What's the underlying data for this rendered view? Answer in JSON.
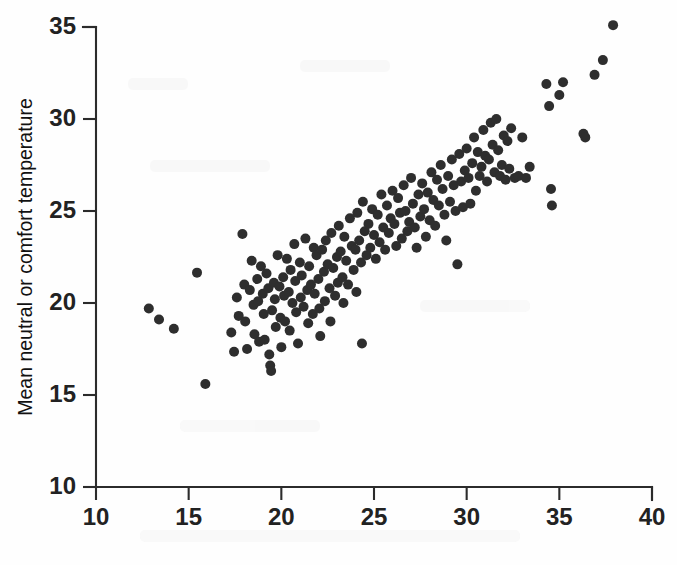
{
  "figure": {
    "background_color": "#fefefe",
    "ink_color": "#2e2e2e",
    "axis_color": "#2b2b2b"
  },
  "axes": {
    "y_title": "Mean neutral or comfort temperature",
    "x_title": "",
    "y_ticks": [
      "10",
      "15",
      "20",
      "25",
      "30",
      "35"
    ],
    "x_ticks": [
      "10",
      "15",
      "20",
      "25",
      "30",
      "35",
      "40"
    ]
  },
  "chart_data": {
    "type": "scatter",
    "title": "",
    "xlabel": "",
    "ylabel": "Mean neutral or comfort temperature",
    "xlim": [
      10,
      40
    ],
    "ylim": [
      10,
      35
    ],
    "xticks": [
      10,
      15,
      20,
      25,
      30,
      35,
      40
    ],
    "yticks": [
      10,
      15,
      20,
      25,
      30,
      35
    ],
    "grid": false,
    "legend": null,
    "marker": "filled-circle",
    "marker_color": "#2e2e2e",
    "marker_size_px": 10,
    "n_points": 186,
    "points": [
      [
        12.85,
        19.7
      ],
      [
        13.4,
        19.1
      ],
      [
        14.2,
        18.6
      ],
      [
        15.45,
        21.65
      ],
      [
        15.9,
        15.6
      ],
      [
        17.3,
        18.4
      ],
      [
        17.45,
        17.35
      ],
      [
        17.6,
        20.3
      ],
      [
        17.7,
        19.3
      ],
      [
        17.9,
        23.75
      ],
      [
        18.0,
        21.0
      ],
      [
        18.05,
        19.0
      ],
      [
        18.15,
        17.5
      ],
      [
        18.3,
        20.7
      ],
      [
        18.4,
        22.3
      ],
      [
        18.5,
        19.9
      ],
      [
        18.55,
        18.3
      ],
      [
        18.7,
        21.3
      ],
      [
        18.75,
        20.1
      ],
      [
        18.8,
        17.9
      ],
      [
        18.9,
        22.0
      ],
      [
        19.0,
        20.5
      ],
      [
        19.05,
        19.4
      ],
      [
        19.1,
        18.0
      ],
      [
        19.2,
        21.6
      ],
      [
        19.3,
        20.8
      ],
      [
        19.35,
        17.2
      ],
      [
        19.4,
        16.6
      ],
      [
        19.45,
        16.3
      ],
      [
        19.5,
        19.6
      ],
      [
        19.6,
        21.1
      ],
      [
        19.65,
        20.2
      ],
      [
        19.7,
        18.7
      ],
      [
        19.8,
        22.6
      ],
      [
        19.9,
        20.9
      ],
      [
        19.95,
        19.2
      ],
      [
        20.0,
        17.6
      ],
      [
        20.1,
        21.4
      ],
      [
        20.15,
        20.4
      ],
      [
        20.2,
        19.0
      ],
      [
        20.3,
        22.4
      ],
      [
        20.4,
        20.6
      ],
      [
        20.45,
        18.5
      ],
      [
        20.5,
        21.8
      ],
      [
        20.6,
        20.0
      ],
      [
        20.7,
        23.2
      ],
      [
        20.75,
        21.2
      ],
      [
        20.8,
        19.5
      ],
      [
        20.9,
        17.8
      ],
      [
        21.0,
        22.2
      ],
      [
        21.05,
        20.3
      ],
      [
        21.1,
        21.5
      ],
      [
        21.2,
        19.8
      ],
      [
        21.3,
        23.5
      ],
      [
        21.4,
        20.7
      ],
      [
        21.45,
        18.9
      ],
      [
        21.5,
        22.0
      ],
      [
        21.6,
        21.0
      ],
      [
        21.7,
        19.4
      ],
      [
        21.75,
        23.0
      ],
      [
        21.8,
        20.5
      ],
      [
        21.9,
        22.6
      ],
      [
        22.0,
        21.3
      ],
      [
        22.05,
        19.7
      ],
      [
        22.1,
        18.2
      ],
      [
        22.2,
        22.9
      ],
      [
        22.3,
        21.7
      ],
      [
        22.35,
        20.1
      ],
      [
        22.4,
        23.4
      ],
      [
        22.5,
        22.1
      ],
      [
        22.6,
        20.8
      ],
      [
        22.65,
        19.0
      ],
      [
        22.7,
        23.8
      ],
      [
        22.8,
        21.9
      ],
      [
        22.9,
        20.4
      ],
      [
        23.0,
        22.5
      ],
      [
        23.05,
        21.1
      ],
      [
        23.1,
        24.2
      ],
      [
        23.2,
        22.8
      ],
      [
        23.3,
        21.4
      ],
      [
        23.35,
        20.0
      ],
      [
        23.4,
        23.6
      ],
      [
        23.5,
        22.3
      ],
      [
        23.6,
        21.0
      ],
      [
        23.7,
        24.6
      ],
      [
        23.8,
        23.1
      ],
      [
        23.9,
        21.8
      ],
      [
        24.0,
        22.9
      ],
      [
        24.05,
        20.6
      ],
      [
        24.1,
        24.9
      ],
      [
        24.2,
        23.4
      ],
      [
        24.3,
        22.2
      ],
      [
        24.35,
        17.8
      ],
      [
        24.4,
        25.5
      ],
      [
        24.5,
        23.9
      ],
      [
        24.6,
        22.6
      ],
      [
        24.7,
        24.3
      ],
      [
        24.8,
        23.0
      ],
      [
        24.9,
        25.1
      ],
      [
        25.0,
        23.7
      ],
      [
        25.1,
        22.4
      ],
      [
        25.2,
        24.8
      ],
      [
        25.3,
        23.3
      ],
      [
        25.4,
        25.9
      ],
      [
        25.5,
        24.1
      ],
      [
        25.6,
        22.9
      ],
      [
        25.7,
        25.3
      ],
      [
        25.8,
        23.8
      ],
      [
        25.9,
        24.6
      ],
      [
        26.0,
        26.1
      ],
      [
        26.1,
        24.3
      ],
      [
        26.2,
        23.1
      ],
      [
        26.3,
        25.7
      ],
      [
        26.4,
        24.9
      ],
      [
        26.5,
        23.5
      ],
      [
        26.6,
        26.4
      ],
      [
        26.7,
        25.0
      ],
      [
        26.8,
        23.9
      ],
      [
        26.9,
        24.4
      ],
      [
        27.0,
        26.8
      ],
      [
        27.1,
        25.4
      ],
      [
        27.2,
        24.1
      ],
      [
        27.3,
        23.0
      ],
      [
        27.4,
        25.9
      ],
      [
        27.5,
        24.7
      ],
      [
        27.6,
        26.5
      ],
      [
        27.7,
        25.1
      ],
      [
        27.8,
        23.6
      ],
      [
        27.9,
        26.0
      ],
      [
        28.0,
        24.5
      ],
      [
        28.1,
        27.1
      ],
      [
        28.2,
        25.6
      ],
      [
        28.3,
        24.2
      ],
      [
        28.4,
        26.7
      ],
      [
        28.5,
        25.3
      ],
      [
        28.6,
        27.5
      ],
      [
        28.7,
        26.2
      ],
      [
        28.8,
        24.8
      ],
      [
        28.9,
        23.4
      ],
      [
        29.0,
        26.9
      ],
      [
        29.1,
        25.5
      ],
      [
        29.2,
        27.8
      ],
      [
        29.3,
        26.4
      ],
      [
        29.4,
        25.0
      ],
      [
        29.5,
        22.1
      ],
      [
        29.6,
        28.1
      ],
      [
        29.7,
        26.6
      ],
      [
        29.8,
        25.2
      ],
      [
        29.9,
        27.2
      ],
      [
        30.0,
        28.4
      ],
      [
        30.1,
        26.8
      ],
      [
        30.2,
        25.4
      ],
      [
        30.3,
        27.6
      ],
      [
        30.4,
        29.0
      ],
      [
        30.5,
        26.1
      ],
      [
        30.6,
        28.2
      ],
      [
        30.7,
        26.9
      ],
      [
        30.8,
        27.4
      ],
      [
        30.9,
        29.4
      ],
      [
        31.0,
        28.0
      ],
      [
        31.1,
        26.6
      ],
      [
        31.2,
        27.8
      ],
      [
        31.3,
        29.8
      ],
      [
        31.4,
        28.6
      ],
      [
        31.5,
        27.1
      ],
      [
        31.6,
        30.0
      ],
      [
        31.7,
        28.3
      ],
      [
        31.8,
        26.9
      ],
      [
        31.9,
        27.5
      ],
      [
        32.0,
        29.1
      ],
      [
        32.1,
        26.7
      ],
      [
        32.2,
        28.8
      ],
      [
        32.3,
        27.3
      ],
      [
        32.4,
        29.5
      ],
      [
        32.6,
        26.8
      ],
      [
        32.8,
        26.9
      ],
      [
        33.0,
        29.0
      ],
      [
        33.2,
        26.8
      ],
      [
        33.4,
        27.4
      ],
      [
        34.3,
        31.9
      ],
      [
        34.45,
        30.7
      ],
      [
        34.55,
        26.2
      ],
      [
        34.6,
        25.3
      ],
      [
        35.0,
        31.3
      ],
      [
        35.2,
        32.0
      ],
      [
        36.3,
        29.2
      ],
      [
        36.4,
        29.0
      ],
      [
        36.9,
        32.4
      ],
      [
        37.35,
        33.2
      ],
      [
        37.9,
        35.1
      ]
    ]
  }
}
